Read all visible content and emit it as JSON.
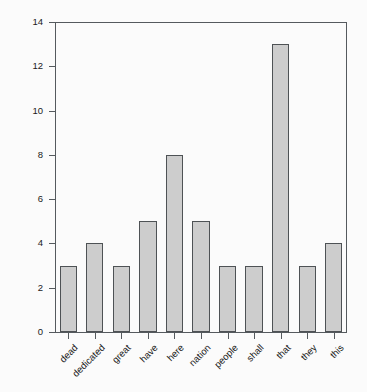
{
  "chart_data": {
    "type": "bar",
    "title": "",
    "subtitle": "",
    "xlabel": "",
    "ylabel": "",
    "categories": [
      "dead",
      "dedicated",
      "great",
      "have",
      "here",
      "nation",
      "people",
      "shall",
      "that",
      "they",
      "this"
    ],
    "values": [
      3,
      4,
      3,
      5,
      8,
      5,
      3,
      3,
      13,
      3,
      4
    ],
    "ylim": [
      0,
      14
    ],
    "yticks": [
      0,
      2,
      4,
      6,
      8,
      10,
      12,
      14
    ],
    "ytick_labels": [
      "0",
      "2",
      "4",
      "6",
      "8",
      "10",
      "12",
      "14"
    ],
    "grid": false,
    "legend": null,
    "legend_position": "none",
    "annotations": [],
    "bar_fill_color": "#cdcdcd",
    "bar_edge_color": "#4e5255",
    "axis_color": "#555a5e",
    "background_color": "#fbfbfb",
    "text_color": "#1a1a1a",
    "xtick_label_rotation": 45
  }
}
